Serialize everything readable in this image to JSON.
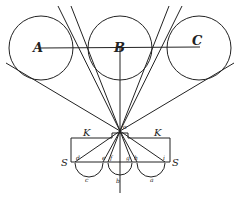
{
  "figure": {
    "labels": {
      "A": "A",
      "B": "B",
      "C": "C",
      "K_left": "K",
      "K_right": "K",
      "S_left": "S",
      "S_right": "S",
      "o": "o",
      "d": "d",
      "e": "e",
      "f": "f",
      "g": "g",
      "h": "h",
      "i": "i",
      "c": "c",
      "b": "b",
      "a": "a"
    },
    "colors": {
      "ink": "#222222",
      "background": "#ffffff"
    }
  }
}
